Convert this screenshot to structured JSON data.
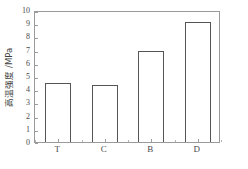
{
  "chart_data": {
    "type": "bar",
    "title": "",
    "subtitle": "",
    "xlabel": "",
    "ylabel": "高温强度 /MPa",
    "categories": [
      "T",
      "C",
      "B",
      "D"
    ],
    "values": [
      4.5,
      4.3,
      6.9,
      9.1
    ],
    "series": [
      {
        "name": "高温强度",
        "values": [
          4.5,
          4.3,
          6.9,
          9.1
        ]
      }
    ],
    "ylim": [
      0,
      10
    ],
    "y_tick_step": 1,
    "y_tick_labels": [
      "0",
      "1",
      "2",
      "3",
      "4",
      "5",
      "6",
      "7",
      "8",
      "9",
      "10"
    ],
    "grid": false,
    "legend": false,
    "legend_position": "none",
    "bar_fill_color": "#ffffff",
    "bar_edge_color": "#555555",
    "axis_color": "#9b9b9b",
    "background_color": "#ffffff",
    "tick_direction": "in"
  }
}
